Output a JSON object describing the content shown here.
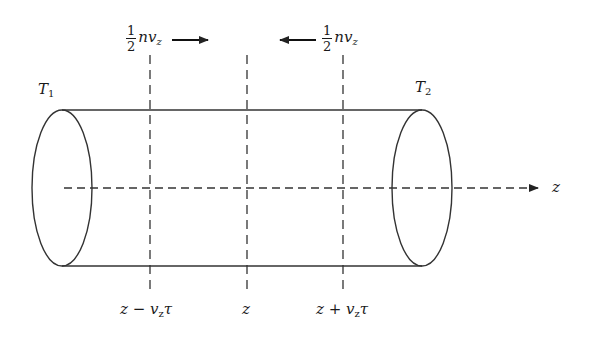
{
  "diagram": {
    "title": "",
    "stroke_color": "#333333",
    "labels": {
      "t1": {
        "base": "T",
        "sub": "1"
      },
      "t2": {
        "base": "T",
        "sub": "2"
      },
      "axis": "z",
      "flux_left": {
        "num": "1",
        "den": "2",
        "expr": "nv",
        "sub": "z",
        "arrow": "right"
      },
      "flux_right": {
        "num": "1",
        "den": "2",
        "expr": "nv",
        "sub": "z",
        "arrow": "left"
      },
      "pos_minus": {
        "pre": "z − v",
        "sub": "z",
        "post": "τ"
      },
      "pos_center": "z",
      "pos_plus": {
        "pre": "z + v",
        "sub": "z",
        "post": "τ"
      }
    },
    "geometry": {
      "left_ellipse": {
        "cx": 62,
        "cy": 188,
        "rx": 30,
        "ry": 78
      },
      "right_ellipse": {
        "cx": 422,
        "cy": 188,
        "rx": 30,
        "ry": 78
      },
      "top_line_y": 110,
      "bottom_line_y": 266,
      "axis_y": 188,
      "axis_x_start": 64,
      "axis_x_end": 540,
      "planes_x": [
        150,
        247,
        343
      ],
      "planes_y": [
        55,
        292
      ]
    }
  }
}
